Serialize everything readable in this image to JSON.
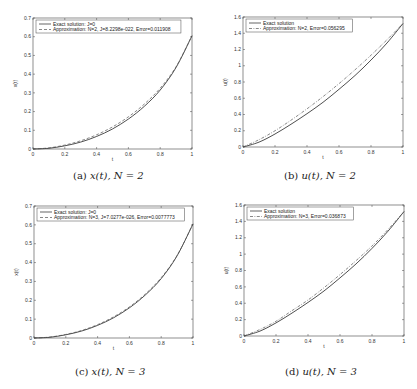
{
  "figure": {
    "panels": [
      {
        "id": "a",
        "caption_prefix": "(a)",
        "caption_math": "x(t), N = 2"
      },
      {
        "id": "b",
        "caption_prefix": "(b)",
        "caption_math": "u(t), N = 2"
      },
      {
        "id": "c",
        "caption_prefix": "(c)",
        "caption_math": "x(t), N = 3"
      },
      {
        "id": "d",
        "caption_prefix": "(d)",
        "caption_math": "u(t), N = 3"
      }
    ]
  },
  "chart_data": [
    {
      "type": "line",
      "title": "(a) x(t), N = 2",
      "xlabel": "t",
      "ylabel": "x(t)",
      "xlim": [
        0,
        1
      ],
      "ylim": [
        0,
        0.7
      ],
      "xticks": [
        "0",
        "0.2",
        "0.4",
        "0.6",
        "0.8",
        "1"
      ],
      "yticks": [
        "0",
        "0.1",
        "0.2",
        "0.3",
        "0.4",
        "0.5",
        "0.6",
        "0.7"
      ],
      "grid": false,
      "legend_position": "upper-left",
      "x": [
        0,
        0.1,
        0.2,
        0.3,
        0.4,
        0.5,
        0.6,
        0.7,
        0.8,
        0.9,
        1.0
      ],
      "series": [
        {
          "name": "Exact solution: J=0",
          "style": "solid",
          "values": [
            0,
            0.004,
            0.017,
            0.037,
            0.067,
            0.107,
            0.16,
            0.228,
            0.315,
            0.436,
            0.605
          ]
        },
        {
          "name": "Approximation: N=2, J=8.2298e-022, Error=0.011908",
          "style": "dash",
          "values": [
            0,
            0.006,
            0.021,
            0.044,
            0.076,
            0.118,
            0.172,
            0.24,
            0.325,
            0.44,
            0.605
          ]
        }
      ]
    },
    {
      "type": "line",
      "title": "(b) u(t), N = 2",
      "xlabel": "t",
      "ylabel": "u(t)",
      "xlim": [
        0,
        1
      ],
      "ylim": [
        0,
        1.6
      ],
      "xticks": [
        "0",
        "0.2",
        "0.4",
        "0.6",
        "0.8",
        "1"
      ],
      "yticks": [
        "0",
        "0.2",
        "0.4",
        "0.6",
        "0.8",
        "1",
        "1.2",
        "1.4",
        "1.6"
      ],
      "grid": false,
      "legend_position": "upper-left",
      "x": [
        0,
        0.1,
        0.2,
        0.3,
        0.4,
        0.5,
        0.6,
        0.7,
        0.8,
        0.9,
        1.0
      ],
      "series": [
        {
          "name": "Exact solution",
          "style": "solid",
          "values": [
            0,
            0.06,
            0.16,
            0.28,
            0.41,
            0.55,
            0.71,
            0.88,
            1.07,
            1.28,
            1.52
          ]
        },
        {
          "name": "Approximation: N=2, Error=0.056295",
          "style": "dashdot",
          "values": [
            0,
            0.09,
            0.2,
            0.33,
            0.47,
            0.62,
            0.78,
            0.95,
            1.13,
            1.32,
            1.52
          ]
        }
      ]
    },
    {
      "type": "line",
      "title": "(c) x(t), N = 3",
      "xlabel": "t",
      "ylabel": "x(t)",
      "xlim": [
        0,
        1
      ],
      "ylim": [
        0,
        0.7
      ],
      "xticks": [
        "0",
        "0.2",
        "0.4",
        "0.6",
        "0.8",
        "1"
      ],
      "yticks": [
        "0",
        "0.1",
        "0.2",
        "0.3",
        "0.4",
        "0.5",
        "0.6",
        "0.7"
      ],
      "grid": false,
      "legend_position": "upper-left",
      "x": [
        0,
        0.1,
        0.2,
        0.3,
        0.4,
        0.5,
        0.6,
        0.7,
        0.8,
        0.9,
        1.0
      ],
      "series": [
        {
          "name": "Exact solution: J=0",
          "style": "solid",
          "values": [
            0,
            0.004,
            0.017,
            0.037,
            0.067,
            0.107,
            0.16,
            0.228,
            0.315,
            0.436,
            0.605
          ]
        },
        {
          "name": "Approximation: N=3, J=7.0277e-026, Error=0.0077773",
          "style": "dash",
          "values": [
            0,
            0.005,
            0.019,
            0.04,
            0.071,
            0.112,
            0.165,
            0.233,
            0.32,
            0.438,
            0.605
          ]
        }
      ]
    },
    {
      "type": "line",
      "title": "(d) u(t), N = 3",
      "xlabel": "t",
      "ylabel": "u(t)",
      "xlim": [
        0,
        1
      ],
      "ylim": [
        0,
        1.6
      ],
      "xticks": [
        "0",
        "0.2",
        "0.4",
        "0.6",
        "0.8",
        "1"
      ],
      "yticks": [
        "0",
        "0.2",
        "0.4",
        "0.6",
        "0.8",
        "1",
        "1.2",
        "1.4",
        "1.6"
      ],
      "grid": false,
      "legend_position": "upper-left",
      "x": [
        0,
        0.1,
        0.2,
        0.3,
        0.4,
        0.5,
        0.6,
        0.7,
        0.8,
        0.9,
        1.0
      ],
      "series": [
        {
          "name": "Exact solution",
          "style": "solid",
          "values": [
            0,
            0.06,
            0.16,
            0.28,
            0.41,
            0.55,
            0.71,
            0.88,
            1.07,
            1.28,
            1.52
          ]
        },
        {
          "name": "Approximation: N=3, Error=0.036873",
          "style": "dashdot",
          "values": [
            0,
            0.08,
            0.18,
            0.31,
            0.44,
            0.59,
            0.75,
            0.92,
            1.1,
            1.3,
            1.52
          ]
        }
      ]
    }
  ]
}
